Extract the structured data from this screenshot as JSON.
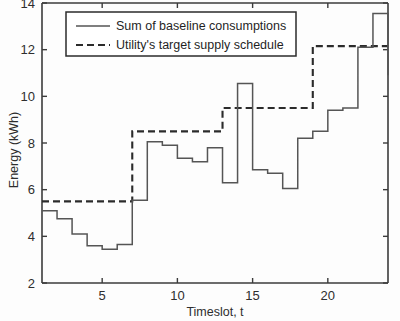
{
  "chart_data": {
    "type": "line",
    "title": "",
    "subtitle": "",
    "xlabel": "Timeslot, t",
    "ylabel": "Energy (kWh)",
    "xlim": [
      1,
      24
    ],
    "ylim": [
      2,
      14
    ],
    "xticks": [
      5,
      10,
      15,
      20
    ],
    "xtick_labels": [
      "5",
      "10",
      "15",
      "20"
    ],
    "yticks": [
      2,
      4,
      6,
      8,
      10,
      12,
      14
    ],
    "ytick_labels": [
      "2",
      "4",
      "6",
      "8",
      "10",
      "12",
      "14"
    ],
    "grid": false,
    "drawstyle": "steps-post",
    "legend_position": "upper-left",
    "legend": [
      "Sum of baseline consumptions",
      "Utility's target supply schedule"
    ],
    "x": [
      1,
      2,
      3,
      4,
      5,
      6,
      7,
      8,
      9,
      10,
      11,
      12,
      13,
      14,
      15,
      16,
      17,
      18,
      19,
      20,
      21,
      22,
      23,
      24
    ],
    "series": [
      {
        "name": "Sum of baseline consumptions",
        "style": "solid",
        "color": "#555555",
        "values": [
          5.1,
          4.75,
          4.1,
          3.6,
          3.45,
          3.65,
          5.55,
          8.05,
          7.9,
          7.35,
          7.2,
          7.8,
          6.3,
          10.55,
          6.85,
          6.7,
          6.05,
          8.2,
          8.5,
          9.4,
          9.5,
          12.1,
          13.55,
          10.9
        ]
      },
      {
        "name": "Utility's target supply schedule",
        "style": "dashed",
        "color": "#2b2b2b",
        "values": [
          5.5,
          5.5,
          5.5,
          5.5,
          5.5,
          5.5,
          8.5,
          8.5,
          8.5,
          8.5,
          8.5,
          8.5,
          9.5,
          9.5,
          9.5,
          9.5,
          9.5,
          9.5,
          12.15,
          12.15,
          12.15,
          12.15,
          12.15,
          12.15
        ]
      }
    ]
  },
  "axes": {
    "x_label": "Timeslot, t",
    "y_label": "Energy (kWh)"
  }
}
